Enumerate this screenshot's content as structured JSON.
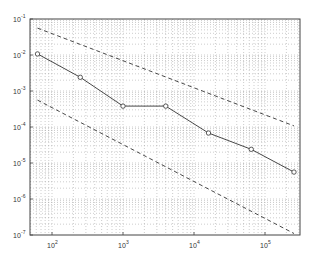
{
  "chart_data": {
    "type": "line",
    "title": "",
    "xlabel": "",
    "ylabel": "",
    "xscale": "log",
    "yscale": "log",
    "xlim": [
      45,
      320000
    ],
    "ylim": [
      1e-07,
      0.1
    ],
    "grid": "major+minor dotted",
    "legend": null,
    "x_ticks": [
      {
        "base": "10",
        "exp": "2",
        "value": 100
      },
      {
        "base": "10",
        "exp": "3",
        "value": 1000
      },
      {
        "base": "10",
        "exp": "4",
        "value": 10000
      },
      {
        "base": "10",
        "exp": "5",
        "value": 100000
      }
    ],
    "y_ticks": [
      {
        "base": "10",
        "exp": "-1",
        "value": 0.1
      },
      {
        "base": "10",
        "exp": "-2",
        "value": 0.01
      },
      {
        "base": "10",
        "exp": "-3",
        "value": 0.001
      },
      {
        "base": "10",
        "exp": "-4",
        "value": 0.0001
      },
      {
        "base": "10",
        "exp": "-5",
        "value": 1e-05
      },
      {
        "base": "10",
        "exp": "-6",
        "value": 1e-06
      },
      {
        "base": "10",
        "exp": "-7",
        "value": 1e-07
      }
    ],
    "series": [
      {
        "name": "error",
        "style": "solid",
        "marker": "circle",
        "color": "#333333",
        "x": [
          62.5,
          250,
          1000,
          4000,
          16000,
          64000,
          256000
        ],
        "y": [
          0.0107,
          0.0024,
          0.00038,
          0.00038,
          6.8e-05,
          2.4e-05,
          5.6e-06
        ]
      },
      {
        "name": "upper reference",
        "style": "dashed",
        "marker": "none",
        "color": "#333333",
        "x": [
          62.5,
          256000
        ],
        "y": [
          0.056,
          0.000107
        ]
      },
      {
        "name": "lower reference",
        "style": "dashed",
        "marker": "none",
        "color": "#333333",
        "x": [
          62.5,
          256000
        ],
        "y": [
          0.00056,
          1.1e-07
        ]
      }
    ]
  }
}
